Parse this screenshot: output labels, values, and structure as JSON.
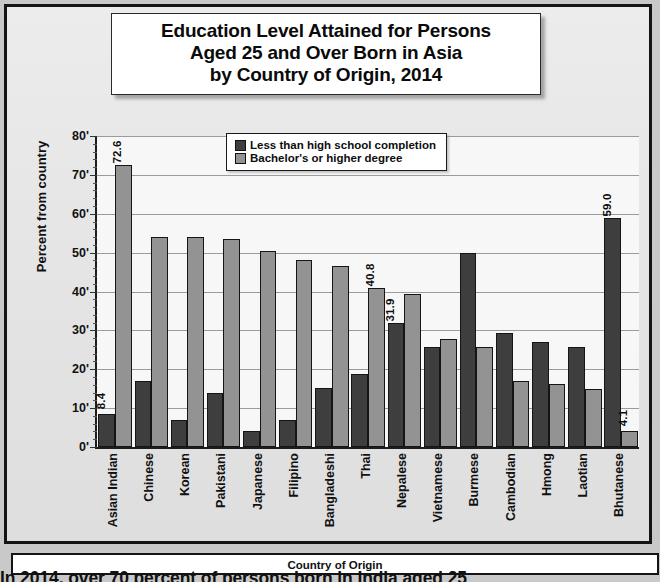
{
  "title": {
    "line1": "Education Level Attained for Persons",
    "line2": "Aged 25 and Over Born in Asia",
    "line3": "by Country of Origin, 2014"
  },
  "axis": {
    "ylabel": "Percent from country",
    "xlabel": "Country of Origin",
    "yticks": [
      "0",
      "10",
      "20",
      "30",
      "40",
      "50",
      "60",
      "70",
      "80"
    ]
  },
  "legend": {
    "items": [
      {
        "label": "Less than high school completion",
        "color": "#3e3e3e"
      },
      {
        "label": "Bachelor's or higher degree",
        "color": "#939393"
      }
    ]
  },
  "caption": "In 2014, over 70 percent of persons born in India aged 25",
  "chart_data": {
    "type": "bar",
    "title": "Education Level Attained for Persons Aged 25 and Over Born in Asia by Country of Origin, 2014",
    "xlabel": "Country of Origin",
    "ylabel": "Percent from country",
    "ylim": [
      0,
      80
    ],
    "ytick_step": 10,
    "grid": true,
    "legend_position": "top-center",
    "categories": [
      "Asian Indian",
      "Chinese",
      "Korean",
      "Pakistani",
      "Japanese",
      "Filipino",
      "Bangladeshi",
      "Thai",
      "Nepalese",
      "Vietnamese",
      "Burmese",
      "Cambodian",
      "Hmong",
      "Laotian",
      "Bhutanese"
    ],
    "series": [
      {
        "name": "Less than high school completion",
        "color": "#3e3e3e",
        "values": [
          8.4,
          17.1,
          7.0,
          13.9,
          4.2,
          6.9,
          15.1,
          18.8,
          31.9,
          25.8,
          50.0,
          29.3,
          27.1,
          25.8,
          59.0
        ],
        "labels": {
          "0": "8.4",
          "8": "31.9",
          "14": "59.0"
        }
      },
      {
        "name": "Bachelor's or higher degree",
        "color": "#939393",
        "values": [
          72.6,
          54.0,
          53.9,
          53.4,
          50.5,
          48.0,
          46.6,
          40.8,
          39.3,
          27.7,
          25.6,
          16.9,
          16.3,
          15.0,
          4.1
        ],
        "labels": {
          "0": "72.6",
          "7": "40.8",
          "14": "4.1"
        }
      }
    ]
  }
}
